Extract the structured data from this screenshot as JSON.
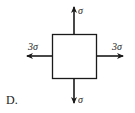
{
  "option_label": "D.",
  "stress_element": {
    "shape": "square",
    "forces": {
      "top": {
        "label": "σ",
        "direction": "up"
      },
      "bottom": {
        "label": "σ",
        "direction": "down"
      },
      "left": {
        "label": "3σ",
        "direction": "left"
      },
      "right": {
        "label": "3σ",
        "direction": "right"
      }
    }
  },
  "colors": {
    "stroke": "#1a1a1a",
    "background": "#ffffff"
  }
}
